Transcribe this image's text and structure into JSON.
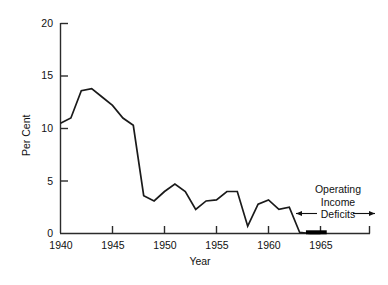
{
  "chart_data": {
    "type": "line",
    "title": "",
    "xlabel": "Year",
    "ylabel": "Per Cent",
    "xlim": [
      1940,
      1965
    ],
    "ylim": [
      0,
      20
    ],
    "grid": false,
    "legend": "none",
    "x_ticks": [
      "1940",
      "1945",
      "1950",
      "1955",
      "1960",
      "1965"
    ],
    "x_tick_values": [
      1940,
      1945,
      1950,
      1955,
      1960,
      1965
    ],
    "y_ticks": [
      "0",
      "5",
      "10",
      "15",
      "20"
    ],
    "y_tick_values": [
      0,
      5,
      10,
      15,
      20
    ],
    "x": [
      1940,
      1941,
      1942,
      1943,
      1944,
      1945,
      1946,
      1947,
      1948,
      1949,
      1950,
      1951,
      1952,
      1953,
      1954,
      1955,
      1956,
      1957,
      1958,
      1959,
      1960,
      1961,
      1962,
      1963,
      1964,
      1965
    ],
    "series": [
      {
        "name": "Per Cent",
        "color": "#1a1a1a",
        "values": [
          10.5,
          11.0,
          13.6,
          13.8,
          13.0,
          12.2,
          11.0,
          10.3,
          3.6,
          3.1,
          4.0,
          4.7,
          4.0,
          2.3,
          3.1,
          3.2,
          4.0,
          4.0,
          0.7,
          2.8,
          3.2,
          2.3,
          2.5,
          0.1,
          0.0,
          0.0
        ]
      }
    ],
    "deficit_segment": {
      "label": "Operating Income Deficits",
      "x_start": 1963.6,
      "x_end": 1965.6,
      "y": 0,
      "color": "#000000"
    },
    "annotations": [
      {
        "name": "operating-income-deficits",
        "lines": [
          "Operating",
          "Income",
          "Deficits"
        ],
        "arrow_left": true,
        "arrow_right": true
      }
    ]
  },
  "axes": {
    "y_title": "Per Cent",
    "x_title": "Year",
    "y_tick_labels": [
      "20",
      "15",
      "10",
      "5",
      "0"
    ],
    "x_tick_labels": [
      "1940",
      "1945",
      "1950",
      "1955",
      "1960",
      "1965"
    ]
  },
  "annotation": {
    "line1": "Operating",
    "line2": "Income",
    "line3": "Deficits"
  },
  "colors": {
    "line": "#1a1a1a",
    "axis": "#2b2b2b",
    "text": "#111111",
    "background": "#ffffff",
    "deficit_bar": "#000000"
  }
}
